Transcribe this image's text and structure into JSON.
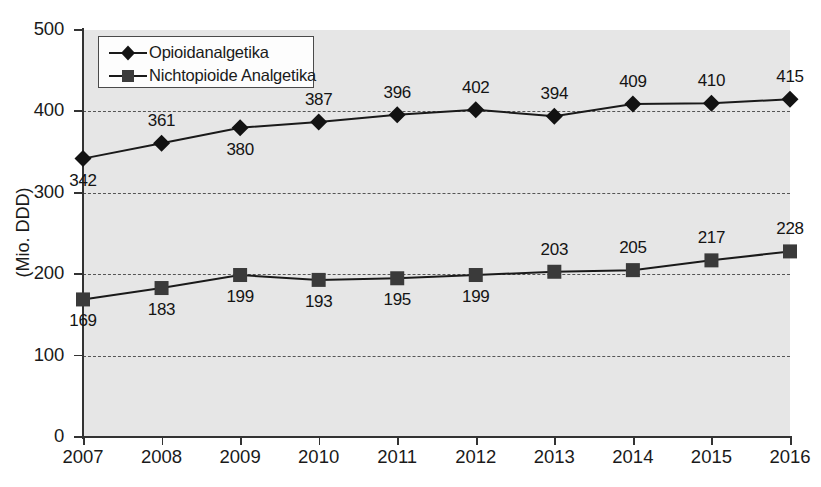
{
  "chart_data": {
    "type": "line",
    "title": "",
    "xlabel": "",
    "ylabel": "(Mio. DDD)",
    "categories": [
      "2007",
      "2008",
      "2009",
      "2010",
      "2011",
      "2012",
      "2013",
      "2014",
      "2015",
      "2016"
    ],
    "series": [
      {
        "name": "Opioidanalgetika",
        "marker": "diamond",
        "values": [
          342,
          361,
          380,
          387,
          396,
          402,
          394,
          409,
          410,
          415
        ],
        "label_positions": [
          "below",
          "above",
          "below",
          "above",
          "above",
          "above",
          "above",
          "above",
          "above",
          "above"
        ]
      },
      {
        "name": "Nichtopioide Analgetika",
        "marker": "square",
        "values": [
          169,
          183,
          199,
          193,
          195,
          199,
          203,
          205,
          217,
          228
        ],
        "label_positions": [
          "below",
          "below",
          "below",
          "below",
          "below",
          "below",
          "above",
          "above",
          "above",
          "above"
        ]
      }
    ],
    "ylim": [
      0,
      500
    ],
    "y_ticks": [
      0,
      100,
      200,
      300,
      400,
      500
    ],
    "y_tick_labels": [
      "0",
      "100",
      "200",
      "300",
      "400",
      "500"
    ],
    "grid": "horizontal-dashed",
    "gridline_values": [
      100,
      200,
      300,
      400
    ],
    "legend_position": "top-left",
    "plot_background": "#e6e6e6",
    "series_color": "#1a1a1a"
  },
  "legend": {
    "entries": [
      {
        "label": "Opioidanalgetika"
      },
      {
        "label": "Nichtopioide Analgetika"
      }
    ]
  }
}
